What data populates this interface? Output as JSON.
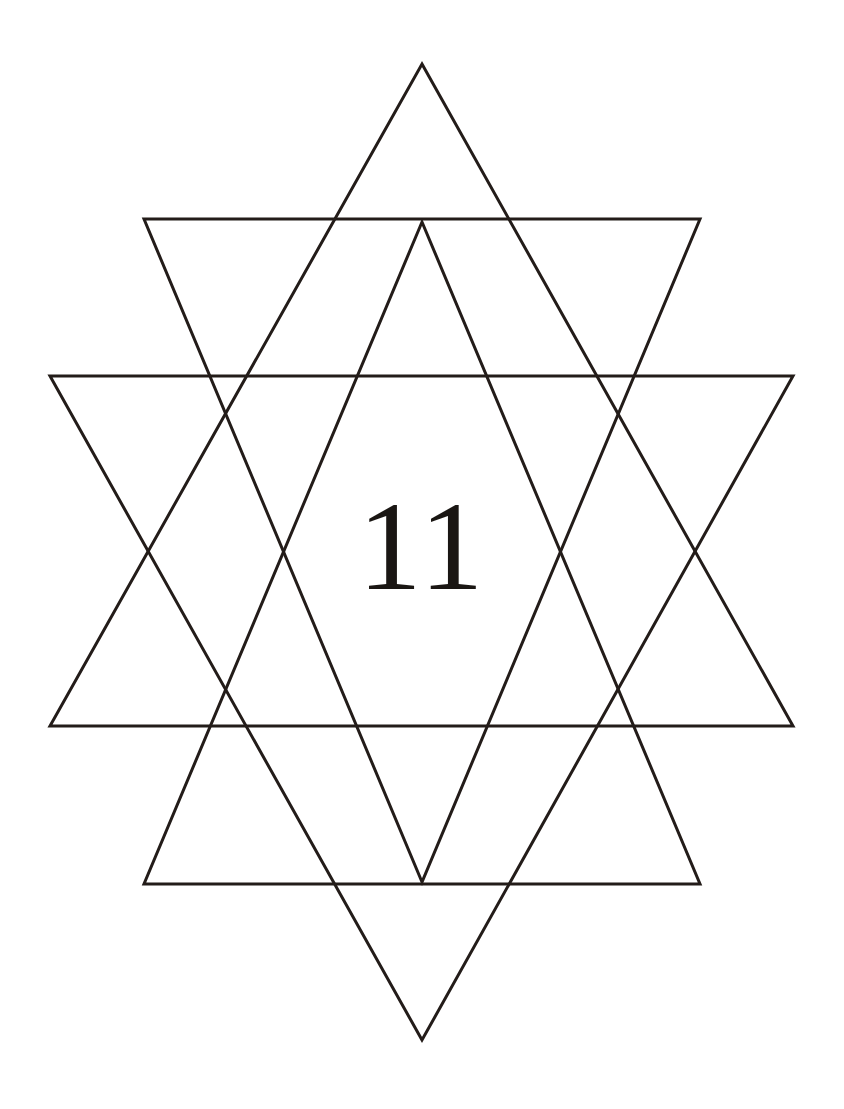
{
  "page": {
    "width": 844,
    "height": 1109,
    "background_color": "#ffffff",
    "stroke_color": "#231c19",
    "stroke_width": 3
  },
  "figure": {
    "name": "nested-hexagram",
    "label": "11",
    "label_center": {
      "x": 422,
      "y": 550
    }
  },
  "chart_data": {
    "type": "diagram",
    "title": "11",
    "xlabel": "",
    "ylabel": "",
    "xlim": [
      0,
      844
    ],
    "ylim": [
      0,
      1109
    ],
    "grid": false,
    "legend": "none",
    "shapes": [
      {
        "name": "outer-triangle-up",
        "kind": "polygon",
        "orientation": "up",
        "fill": "none",
        "stroke": "#231c19",
        "points": [
          [
            422,
            64
          ],
          [
            793,
            726
          ],
          [
            50,
            726
          ]
        ]
      },
      {
        "name": "outer-triangle-down",
        "kind": "polygon",
        "orientation": "down",
        "fill": "none",
        "stroke": "#231c19",
        "points": [
          [
            422,
            1040
          ],
          [
            50,
            376
          ],
          [
            793,
            376
          ]
        ]
      },
      {
        "name": "inner-triangle-up",
        "kind": "polygon",
        "orientation": "up",
        "fill": "none",
        "stroke": "#231c19",
        "points": [
          [
            422,
            222
          ],
          [
            700,
            884
          ],
          [
            144,
            884
          ]
        ]
      },
      {
        "name": "inner-triangle-down",
        "kind": "polygon",
        "orientation": "down",
        "fill": "none",
        "stroke": "#231c19",
        "points": [
          [
            422,
            882
          ],
          [
            144,
            219
          ],
          [
            700,
            219
          ]
        ]
      }
    ],
    "horizontal_rules": [
      {
        "name": "rule-top",
        "y": 219,
        "x_start": 50,
        "x_end": 793
      },
      {
        "name": "rule-upper-mid",
        "y": 376,
        "x_start": 50,
        "x_end": 793
      },
      {
        "name": "rule-lower-mid",
        "y": 726,
        "x_start": 50,
        "x_end": 793
      },
      {
        "name": "rule-bottom",
        "y": 884,
        "x_start": 50,
        "x_end": 793
      }
    ],
    "apexes": {
      "top": [
        422,
        64
      ],
      "bottom": [
        422,
        1040
      ],
      "inner_top": [
        422,
        222
      ],
      "inner_bottom": [
        422,
        882
      ]
    }
  }
}
